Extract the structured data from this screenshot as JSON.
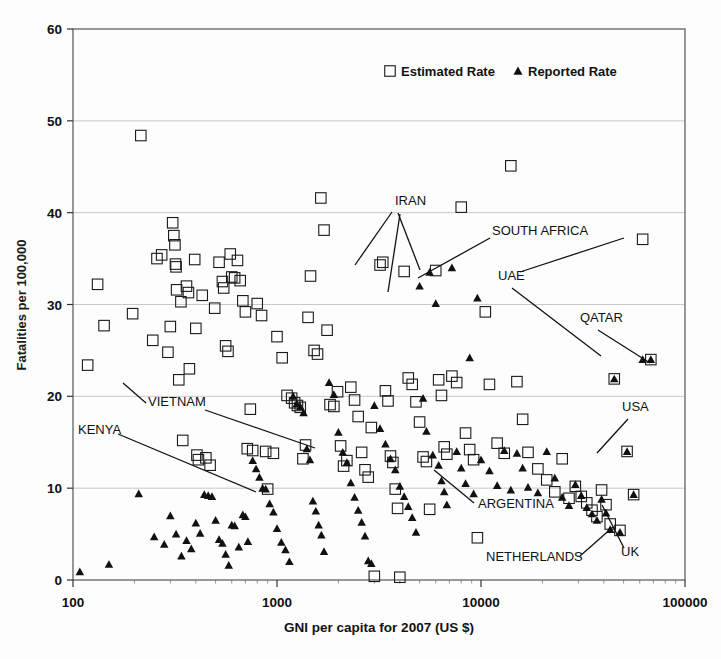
{
  "chart_data": {
    "type": "scatter",
    "title": "",
    "xlabel": "GNI per capita for 2007 (US $)",
    "ylabel": "Fatalities per 100,000",
    "xscale": "log",
    "xlim": [
      100,
      100000
    ],
    "ylim": [
      0,
      60
    ],
    "xticks": [
      100,
      1000,
      10000,
      100000
    ],
    "xtick_labels": [
      "100",
      "1000",
      "10000",
      "100000"
    ],
    "yticks": [
      0,
      10,
      20,
      30,
      40,
      50,
      60
    ],
    "ytick_labels": [
      "0",
      "10",
      "20",
      "30",
      "40",
      "50",
      "60"
    ],
    "grid": "horizontal",
    "legend_position": "top-center",
    "series": [
      {
        "name": "Estimated Rate",
        "marker": "open-square",
        "points": [
          [
            118,
            23.4
          ],
          [
            132,
            32.2
          ],
          [
            142,
            27.7
          ],
          [
            196,
            29.0
          ],
          [
            215,
            48.4
          ],
          [
            246,
            26.1
          ],
          [
            258,
            35.0
          ],
          [
            272,
            35.4
          ],
          [
            292,
            24.8
          ],
          [
            300,
            27.6
          ],
          [
            308,
            38.9
          ],
          [
            312,
            37.5
          ],
          [
            316,
            36.5
          ],
          [
            318,
            34.4
          ],
          [
            320,
            34.1
          ],
          [
            322,
            31.6
          ],
          [
            330,
            21.8
          ],
          [
            338,
            30.3
          ],
          [
            345,
            15.2
          ],
          [
            360,
            32.0
          ],
          [
            368,
            31.3
          ],
          [
            372,
            23.0
          ],
          [
            395,
            34.9
          ],
          [
            400,
            27.4
          ],
          [
            405,
            13.6
          ],
          [
            412,
            13.1
          ],
          [
            430,
            31.0
          ],
          [
            448,
            13.3
          ],
          [
            470,
            12.5
          ],
          [
            495,
            29.6
          ],
          [
            520,
            34.6
          ],
          [
            540,
            32.5
          ],
          [
            548,
            31.8
          ],
          [
            560,
            25.5
          ],
          [
            575,
            24.9
          ],
          [
            590,
            35.5
          ],
          [
            600,
            33.0
          ],
          [
            620,
            32.9
          ],
          [
            640,
            34.8
          ],
          [
            660,
            32.6
          ],
          [
            680,
            30.4
          ],
          [
            700,
            29.2
          ],
          [
            715,
            14.3
          ],
          [
            740,
            18.6
          ],
          [
            760,
            14.1
          ],
          [
            800,
            30.1
          ],
          [
            840,
            28.8
          ],
          [
            880,
            14.0
          ],
          [
            900,
            9.9
          ],
          [
            960,
            13.8
          ],
          [
            1000,
            26.5
          ],
          [
            1060,
            24.2
          ],
          [
            1120,
            20.1
          ],
          [
            1180,
            19.8
          ],
          [
            1220,
            19.3
          ],
          [
            1260,
            19.0
          ],
          [
            1300,
            18.8
          ],
          [
            1340,
            13.2
          ],
          [
            1380,
            14.7
          ],
          [
            1420,
            28.6
          ],
          [
            1460,
            33.1
          ],
          [
            1520,
            25.0
          ],
          [
            1580,
            24.6
          ],
          [
            1640,
            41.6
          ],
          [
            1700,
            38.1
          ],
          [
            1760,
            27.2
          ],
          [
            1820,
            19.1
          ],
          [
            1900,
            18.9
          ],
          [
            1980,
            20.5
          ],
          [
            2050,
            14.6
          ],
          [
            2120,
            12.4
          ],
          [
            2200,
            13.0
          ],
          [
            2300,
            21.0
          ],
          [
            2400,
            19.6
          ],
          [
            2500,
            17.8
          ],
          [
            2600,
            13.9
          ],
          [
            2700,
            12.0
          ],
          [
            2800,
            11.2
          ],
          [
            2900,
            16.6
          ],
          [
            3000,
            0.4
          ],
          [
            3200,
            34.3
          ],
          [
            3300,
            34.6
          ],
          [
            3400,
            20.6
          ],
          [
            3500,
            19.5
          ],
          [
            3600,
            13.5
          ],
          [
            3700,
            12.8
          ],
          [
            3800,
            9.9
          ],
          [
            3900,
            7.8
          ],
          [
            4000,
            0.3
          ],
          [
            4200,
            33.6
          ],
          [
            4400,
            22.0
          ],
          [
            4600,
            21.3
          ],
          [
            4800,
            19.4
          ],
          [
            5000,
            17.2
          ],
          [
            5200,
            13.4
          ],
          [
            5400,
            12.9
          ],
          [
            5600,
            7.7
          ],
          [
            6000,
            33.7
          ],
          [
            6200,
            21.8
          ],
          [
            6400,
            20.1
          ],
          [
            6600,
            14.5
          ],
          [
            6800,
            13.7
          ],
          [
            7200,
            22.2
          ],
          [
            7600,
            21.5
          ],
          [
            8000,
            40.6
          ],
          [
            8400,
            16.0
          ],
          [
            8800,
            14.2
          ],
          [
            9200,
            13.1
          ],
          [
            9600,
            4.6
          ],
          [
            10500,
            29.2
          ],
          [
            11000,
            21.3
          ],
          [
            12000,
            14.9
          ],
          [
            13000,
            13.8
          ],
          [
            14000,
            45.1
          ],
          [
            15000,
            21.6
          ],
          [
            16000,
            17.5
          ],
          [
            17000,
            13.9
          ],
          [
            19000,
            12.1
          ],
          [
            21000,
            10.9
          ],
          [
            23000,
            9.6
          ],
          [
            25000,
            13.2
          ],
          [
            27000,
            8.9
          ],
          [
            29000,
            10.2
          ],
          [
            31000,
            9.1
          ],
          [
            33000,
            8.4
          ],
          [
            35000,
            7.6
          ],
          [
            37000,
            6.9
          ],
          [
            39000,
            9.8
          ],
          [
            41000,
            8.2
          ],
          [
            43000,
            6.1
          ],
          [
            45000,
            21.9
          ],
          [
            48000,
            5.4
          ],
          [
            52000,
            14.0
          ],
          [
            56000,
            9.3
          ],
          [
            62000,
            37.1
          ],
          [
            68000,
            24.0
          ]
        ]
      },
      {
        "name": "Reported Rate",
        "marker": "filled-triangle",
        "points": [
          [
            108,
            0.9
          ],
          [
            150,
            1.7
          ],
          [
            210,
            9.4
          ],
          [
            250,
            4.7
          ],
          [
            280,
            3.9
          ],
          [
            300,
            7.0
          ],
          [
            320,
            5.0
          ],
          [
            340,
            2.6
          ],
          [
            360,
            4.3
          ],
          [
            380,
            3.4
          ],
          [
            400,
            6.2
          ],
          [
            420,
            5.1
          ],
          [
            440,
            9.3
          ],
          [
            460,
            9.2
          ],
          [
            480,
            9.1
          ],
          [
            500,
            6.5
          ],
          [
            520,
            4.4
          ],
          [
            540,
            4.0
          ],
          [
            560,
            2.8
          ],
          [
            580,
            1.6
          ],
          [
            600,
            6.0
          ],
          [
            620,
            5.9
          ],
          [
            650,
            3.6
          ],
          [
            680,
            7.1
          ],
          [
            700,
            6.9
          ],
          [
            720,
            4.2
          ],
          [
            760,
            13.0
          ],
          [
            790,
            12.1
          ],
          [
            820,
            11.2
          ],
          [
            850,
            10.0
          ],
          [
            880,
            9.9
          ],
          [
            920,
            8.3
          ],
          [
            960,
            7.4
          ],
          [
            1000,
            5.6
          ],
          [
            1050,
            4.1
          ],
          [
            1100,
            3.3
          ],
          [
            1150,
            2.0
          ],
          [
            1200,
            20.0
          ],
          [
            1250,
            19.2
          ],
          [
            1300,
            18.9
          ],
          [
            1350,
            18.2
          ],
          [
            1400,
            14.3
          ],
          [
            1450,
            13.1
          ],
          [
            1500,
            8.6
          ],
          [
            1550,
            7.5
          ],
          [
            1600,
            6.0
          ],
          [
            1650,
            4.9
          ],
          [
            1700,
            3.1
          ],
          [
            1800,
            21.5
          ],
          [
            1900,
            20.2
          ],
          [
            2000,
            16.1
          ],
          [
            2100,
            13.9
          ],
          [
            2200,
            12.8
          ],
          [
            2300,
            10.6
          ],
          [
            2400,
            9.0
          ],
          [
            2500,
            7.6
          ],
          [
            2600,
            6.3
          ],
          [
            2700,
            4.8
          ],
          [
            2800,
            2.1
          ],
          [
            2900,
            1.8
          ],
          [
            3000,
            19.0
          ],
          [
            3200,
            16.5
          ],
          [
            3400,
            14.8
          ],
          [
            3600,
            13.2
          ],
          [
            3800,
            12.0
          ],
          [
            4000,
            10.2
          ],
          [
            4200,
            9.1
          ],
          [
            4400,
            8.0
          ],
          [
            4600,
            6.8
          ],
          [
            4800,
            5.2
          ],
          [
            5000,
            32.0
          ],
          [
            5200,
            19.8
          ],
          [
            5400,
            16.2
          ],
          [
            5600,
            33.5
          ],
          [
            5800,
            13.6
          ],
          [
            6000,
            30.1
          ],
          [
            6200,
            12.5
          ],
          [
            6400,
            10.8
          ],
          [
            6600,
            9.6
          ],
          [
            6800,
            8.2
          ],
          [
            7200,
            34.0
          ],
          [
            7600,
            14.0
          ],
          [
            8000,
            12.2
          ],
          [
            8400,
            10.5
          ],
          [
            8800,
            24.2
          ],
          [
            9200,
            9.4
          ],
          [
            9600,
            30.7
          ],
          [
            10000,
            13.1
          ],
          [
            11000,
            11.9
          ],
          [
            12000,
            10.3
          ],
          [
            13000,
            14.1
          ],
          [
            14000,
            9.8
          ],
          [
            15000,
            13.8
          ],
          [
            16000,
            12.2
          ],
          [
            17000,
            10.1
          ],
          [
            19000,
            9.5
          ],
          [
            21000,
            14.0
          ],
          [
            23000,
            11.1
          ],
          [
            25000,
            9.0
          ],
          [
            27000,
            8.1
          ],
          [
            29000,
            10.4
          ],
          [
            31000,
            9.2
          ],
          [
            33000,
            7.9
          ],
          [
            35000,
            7.2
          ],
          [
            37000,
            6.5
          ],
          [
            39000,
            8.8
          ],
          [
            41000,
            7.3
          ],
          [
            43000,
            5.5
          ],
          [
            45000,
            21.9
          ],
          [
            48000,
            5.2
          ],
          [
            52000,
            14.0
          ],
          [
            56000,
            9.3
          ],
          [
            62000,
            24.0
          ],
          [
            68000,
            24.0
          ]
        ]
      }
    ],
    "annotations": [
      {
        "label": "IRAN",
        "x": 395,
        "y": 205,
        "lines": [
          [
            392,
            212,
            355,
            265
          ],
          [
            398,
            213,
            420,
            270
          ],
          [
            400,
            214,
            388,
            292
          ]
        ]
      },
      {
        "label": "SOUTH AFRICA",
        "x": 492,
        "y": 235,
        "lines": [
          [
            490,
            238,
            418,
            278
          ]
        ]
      },
      {
        "label": "UAE",
        "x": 498,
        "y": 280,
        "lines": [
          [
            520,
            272,
            624,
            238
          ],
          [
            512,
            288,
            601,
            356
          ]
        ]
      },
      {
        "label": "QATAR",
        "x": 580,
        "y": 322,
        "lines": [
          [
            598,
            330,
            650,
            363
          ]
        ]
      },
      {
        "label": "USA",
        "x": 622,
        "y": 411,
        "lines": [
          [
            628,
            419,
            597,
            453
          ]
        ]
      },
      {
        "label": "KENYA",
        "x": 78,
        "y": 434,
        "lines": [
          [
            118,
            434,
            256,
            492
          ]
        ]
      },
      {
        "label": "VIETNAM",
        "x": 148,
        "y": 406,
        "lines": [
          [
            146,
            403,
            123,
            383
          ],
          [
            205,
            410,
            315,
            448
          ]
        ]
      },
      {
        "label": "ARGENTINA",
        "x": 478,
        "y": 508,
        "lines": [
          [
            474,
            503,
            434,
            470
          ]
        ]
      },
      {
        "label": "NETHERLANDS",
        "x": 486,
        "y": 561,
        "lines": [
          [
            580,
            556,
            613,
            527
          ]
        ]
      },
      {
        "label": "UK",
        "x": 621,
        "y": 556,
        "lines": [
          [
            624,
            548,
            602,
            505
          ]
        ]
      }
    ]
  },
  "legend": {
    "estimated_label": "Estimated Rate",
    "reported_label": "Reported Rate"
  },
  "axes": {
    "y_title": "Fatalities per 100,000",
    "x_title": "GNI per capita for 2007 (US $)"
  },
  "colors": {
    "marker_stroke": "#1a1a1a",
    "marker_fill": "#111111",
    "grid": "#c8c8c8",
    "frame": "#555555",
    "background": "#fdfdfd"
  }
}
